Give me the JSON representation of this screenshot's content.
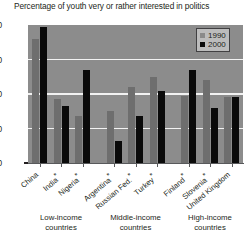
{
  "chart_data": {
    "type": "bar",
    "title": "Percentage of youth very or rather interested in politics",
    "xlabel": "",
    "ylabel": "",
    "ylim": [
      0,
      80
    ],
    "yticks": [
      "0",
      "20",
      "40",
      "60",
      "80"
    ],
    "grid": true,
    "legend_position": "top-right",
    "categories": [
      "China",
      "India*",
      "Nigeria*",
      "Argentina*",
      "Russian Fed.*",
      "Turkey*",
      "Finland*",
      "Slovenia*",
      "United Kingdom"
    ],
    "series": [
      {
        "name": "1990",
        "color": "#6e6e6e",
        "values": [
          72,
          37,
          27,
          30,
          44,
          50,
          39,
          48,
          38
        ]
      },
      {
        "name": "2000",
        "color": "#0a0a0a",
        "values": [
          79,
          33,
          54,
          13,
          27,
          42,
          54,
          32,
          38
        ]
      }
    ],
    "group_labels": [
      "Low-income countries",
      "Middle-income countries",
      "High-income countries"
    ]
  },
  "legend": {
    "entries": [
      {
        "label": "1990",
        "swatch": "legend-swatch-1990"
      },
      {
        "label": "2000",
        "swatch": "legend-swatch-2000"
      }
    ]
  },
  "groups": {
    "low": {
      "line1": "Low-income",
      "line2": "countries"
    },
    "middle": {
      "line1": "Middle-income",
      "line2": "countries"
    },
    "high": {
      "line1": "High-income",
      "line2": "countries"
    }
  }
}
